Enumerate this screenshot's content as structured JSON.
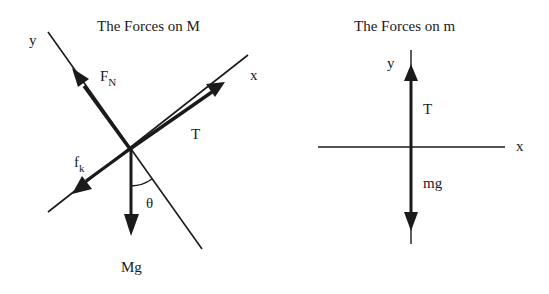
{
  "left_diagram": {
    "title": "The Forces on M",
    "axes": {
      "x_label": "x",
      "y_label": "y"
    },
    "forces": [
      {
        "name": "F",
        "subscript": "N",
        "direction": "along +y (up-left)"
      },
      {
        "name": "T",
        "subscript": "",
        "direction": "along +x (up-right)"
      },
      {
        "name": "f",
        "subscript": "k",
        "direction": "along -x (down-left)"
      },
      {
        "name": "Mg",
        "subscript": "",
        "direction": "straight down"
      }
    ],
    "angle_label": "θ",
    "labels": {
      "fn_main": "F",
      "fn_sub": "N",
      "t": "T",
      "fk_main": "f",
      "fk_sub": "k",
      "mg": "Mg",
      "theta": "θ"
    }
  },
  "right_diagram": {
    "title": "The Forces on m",
    "axes": {
      "x_label": "x",
      "y_label": "y"
    },
    "forces": [
      {
        "name": "T",
        "direction": "up"
      },
      {
        "name": "mg",
        "direction": "down"
      }
    ],
    "labels": {
      "t": "T",
      "mg": "mg"
    }
  },
  "colors": {
    "ink": "#1a1a1a",
    "background": "#ffffff"
  }
}
